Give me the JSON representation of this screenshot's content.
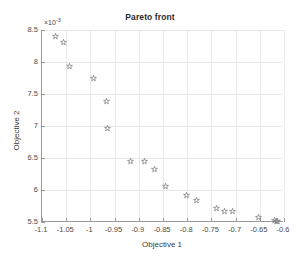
{
  "chart_data": {
    "type": "scatter",
    "title": "Pareto front",
    "xlabel": "Objective 1",
    "ylabel": "Objective 2",
    "y_exponent_label": "×10",
    "y_exponent_value": "-3",
    "xlim": [
      -1.1,
      -0.6
    ],
    "ylim": [
      5.5,
      8.5
    ],
    "y_scale_factor": 0.001,
    "grid": true,
    "legend": null,
    "marker": "hexagram",
    "marker_color": "#7d7d85",
    "xticks": [
      -1.1,
      -1.05,
      -1,
      -0.95,
      -0.9,
      -0.85,
      -0.8,
      -0.75,
      -0.7,
      -0.65,
      -0.6
    ],
    "xticklabels": [
      "-1.1",
      "-1.05",
      "-1",
      "-0.95",
      "-0.9",
      "-0.85",
      "-0.8",
      "-0.75",
      "-0.7",
      "-0.65",
      "-0.6"
    ],
    "yticks": [
      5.5,
      6,
      6.5,
      7,
      7.5,
      8,
      8.5
    ],
    "yticklabels": [
      "5.5",
      "6",
      "6.5",
      "7",
      "7.5",
      "8",
      "8.5"
    ],
    "points": [
      {
        "x": -1.073,
        "y": 8.4
      },
      {
        "x": -1.056,
        "y": 8.3
      },
      {
        "x": -1.044,
        "y": 7.93
      },
      {
        "x": -0.993,
        "y": 7.74
      },
      {
        "x": -0.966,
        "y": 7.38
      },
      {
        "x": -0.964,
        "y": 6.96
      },
      {
        "x": -0.917,
        "y": 6.45
      },
      {
        "x": -0.889,
        "y": 6.44
      },
      {
        "x": -0.868,
        "y": 6.32
      },
      {
        "x": -0.845,
        "y": 6.06
      },
      {
        "x": -0.801,
        "y": 5.92
      },
      {
        "x": -0.78,
        "y": 5.84
      },
      {
        "x": -0.739,
        "y": 5.71
      },
      {
        "x": -0.723,
        "y": 5.67
      },
      {
        "x": -0.707,
        "y": 5.66
      },
      {
        "x": -0.653,
        "y": 5.57
      },
      {
        "x": -0.62,
        "y": 5.52
      },
      {
        "x": -0.616,
        "y": 5.51
      },
      {
        "x": -0.613,
        "y": 5.51
      }
    ]
  }
}
